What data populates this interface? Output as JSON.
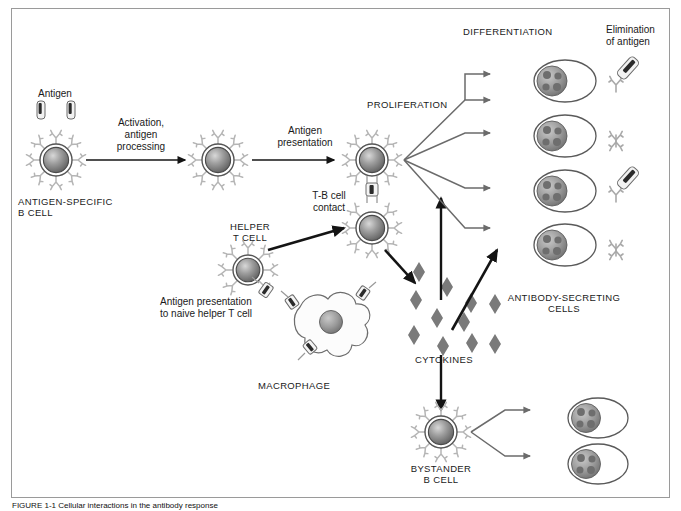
{
  "figure": {
    "domain": "biology-immunology-diagram",
    "title_visible": false,
    "border_color": "#9a9a9a",
    "background": "#ffffff"
  },
  "palette": {
    "cell_outline": "#4d4d4d",
    "cell_fill_light": "#cfcfcf",
    "cell_fill_dark": "#6e6e6e",
    "receptor": "#b8b8b8",
    "arrow_black": "#141414",
    "arrow_gray": "#6b6b6b",
    "cytokine": "#7a7a7a",
    "antigen_dark": "#2b2b2b",
    "text": "#1a1a1a"
  },
  "labels": {
    "antigen": "Antigen",
    "activation": "Activation,\nantigen\nprocessing",
    "antigen_specific_bcell": "ANTIGEN-SPECIFIC\nB CELL",
    "antigen_presentation": "Antigen\npresentation",
    "tb_cell_contact": "T-B cell\ncontact",
    "helper_t_cell": "HELPER\nT CELL",
    "antigen_presentation_naive": "Antigen presentation\nto naive helper T cell",
    "macrophage": "MACROPHAGE",
    "proliferation": "PROLIFERATION",
    "differentiation": "DIFFERENTIATION",
    "elimination_of_antigen": "Elimination\nof antigen",
    "cytokines": "CYTOKINES",
    "antibody_secreting_cells": "ANTIBODY-SECRETING\nCELLS",
    "bystander_bcell": "BYSTANDER\nB CELL"
  },
  "caption": {
    "text": "FIGURE 1-1   Cellular interactions in the antibody response",
    "truncated": true
  },
  "elements": {
    "antigen_particles": 2,
    "b_cells": 4,
    "t_cells": 2,
    "macrophages": 1,
    "plasma_cells_top_group": 4,
    "plasma_cells_bottom_group": 2,
    "cytokine_diamonds": 11,
    "antibodies_with_antigen": 2,
    "antibodies_free": 2
  },
  "icons": {
    "antigen": "antigen-icon",
    "b_cell": "b-cell-icon",
    "t_cell": "t-cell-icon",
    "macrophage": "macrophage-icon",
    "plasma_cell": "plasma-cell-icon",
    "antibody": "antibody-icon",
    "cytokine": "cytokine-diamond-icon",
    "mhc_complex": "mhc-peptide-complex-icon",
    "arrow": "arrow-icon"
  }
}
